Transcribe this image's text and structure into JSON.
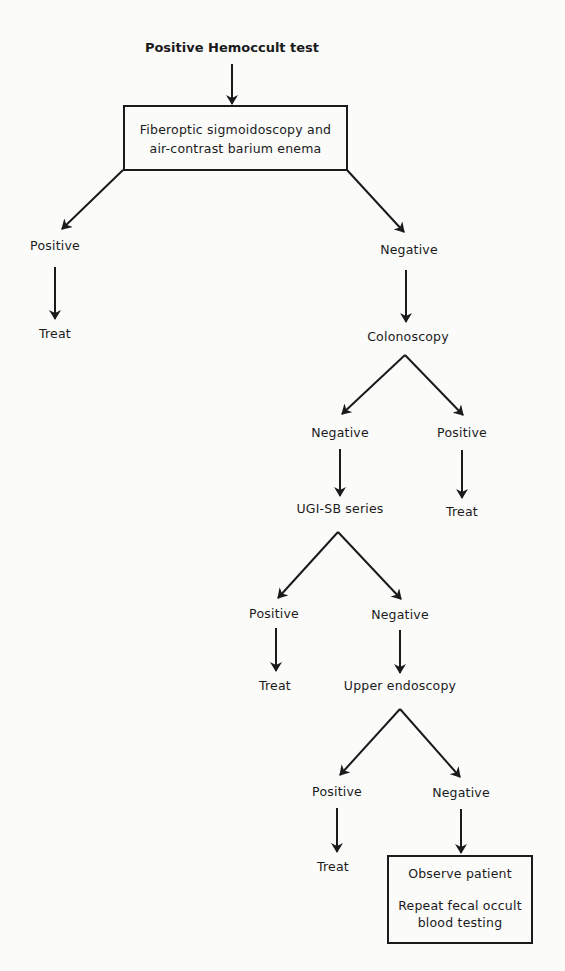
{
  "diagram": {
    "title": "Positive Hemoccult test",
    "nodes": {
      "initial_test_box": {
        "line1": "Fiberoptic sigmoidoscopy and",
        "line2": "air-contrast barium enema"
      },
      "first_positive": "Positive",
      "first_positive_treat": "Treat",
      "first_negative": "Negative",
      "colonoscopy": "Colonoscopy",
      "colonoscopy_negative": "Negative",
      "colonoscopy_positive": "Positive",
      "colonoscopy_positive_treat": "Treat",
      "ugi_sb_series": "UGI-SB series",
      "ugi_positive": "Positive",
      "ugi_positive_treat": "Treat",
      "ugi_negative": "Negative",
      "upper_endoscopy": "Upper endoscopy",
      "endoscopy_positive": "Positive",
      "endoscopy_positive_treat": "Treat",
      "endoscopy_negative": "Negative",
      "final_box": {
        "line1": "Observe patient",
        "line2": "Repeat fecal occult",
        "line3": "blood testing"
      }
    },
    "edges": [
      {
        "from": "Positive Hemoccult test",
        "to": "Fiberoptic sigmoidoscopy and air-contrast barium enema"
      },
      {
        "from": "Fiberoptic sigmoidoscopy and air-contrast barium enema",
        "to": "Positive"
      },
      {
        "from": "Positive",
        "to": "Treat"
      },
      {
        "from": "Fiberoptic sigmoidoscopy and air-contrast barium enema",
        "to": "Negative"
      },
      {
        "from": "Negative",
        "to": "Colonoscopy"
      },
      {
        "from": "Colonoscopy",
        "to": "Negative"
      },
      {
        "from": "Colonoscopy",
        "to": "Positive"
      },
      {
        "from": "Positive",
        "to": "Treat"
      },
      {
        "from": "Negative",
        "to": "UGI-SB series"
      },
      {
        "from": "UGI-SB series",
        "to": "Positive"
      },
      {
        "from": "Positive",
        "to": "Treat"
      },
      {
        "from": "UGI-SB series",
        "to": "Negative"
      },
      {
        "from": "Negative",
        "to": "Upper endoscopy"
      },
      {
        "from": "Upper endoscopy",
        "to": "Positive"
      },
      {
        "from": "Positive",
        "to": "Treat"
      },
      {
        "from": "Upper endoscopy",
        "to": "Negative"
      },
      {
        "from": "Negative",
        "to": "Observe patient / Repeat fecal occult blood testing"
      }
    ],
    "colors": {
      "ink": "#1a1a1a",
      "background": "#fbfbfa"
    }
  }
}
